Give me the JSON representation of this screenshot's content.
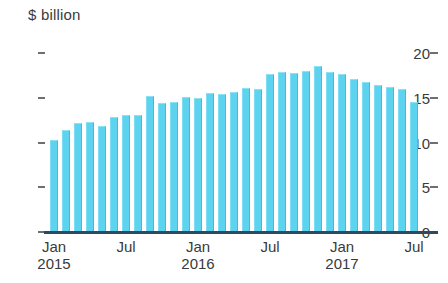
{
  "chart_data": {
    "type": "bar",
    "title": "$ billion",
    "xlabel": "",
    "ylabel": "$ billion",
    "ylim": [
      0,
      20
    ],
    "yticks": [
      0,
      5,
      10,
      15,
      20
    ],
    "ytick_labels": [
      "0",
      "5",
      "10",
      "15",
      "20"
    ],
    "grid": false,
    "legend": null,
    "bar_color": "#5cd3ef",
    "axis_color": "#2e4a63",
    "x_tick_positions": [
      0,
      6,
      12,
      18,
      24,
      30
    ],
    "x_tick_labels": [
      {
        "month": "Jan",
        "year": "2015"
      },
      {
        "month": "Jul",
        "year": ""
      },
      {
        "month": "Jan",
        "year": "2016"
      },
      {
        "month": "Jul",
        "year": ""
      },
      {
        "month": "Jan",
        "year": "2017"
      },
      {
        "month": "Jul",
        "year": ""
      }
    ],
    "categories": [
      "Jan 2015",
      "Feb 2015",
      "Mar 2015",
      "Apr 2015",
      "May 2015",
      "Jun 2015",
      "Jul 2015",
      "Aug 2015",
      "Sep 2015",
      "Oct 2015",
      "Nov 2015",
      "Dec 2015",
      "Jan 2016",
      "Feb 2016",
      "Mar 2016",
      "Apr 2016",
      "May 2016",
      "Jun 2016",
      "Jul 2016",
      "Aug 2016",
      "Sep 2016",
      "Oct 2016",
      "Nov 2016",
      "Dec 2016",
      "Jan 2017",
      "Feb 2017",
      "Mar 2017",
      "Apr 2017",
      "May 2017",
      "Jun 2017",
      "Jul 2017"
    ],
    "values": [
      10.3,
      11.4,
      12.2,
      12.3,
      11.8,
      12.8,
      13.1,
      13.1,
      15.2,
      14.4,
      14.5,
      15.1,
      15.0,
      15.5,
      15.4,
      15.7,
      16.1,
      16.0,
      17.7,
      17.9,
      17.8,
      18.0,
      18.5,
      17.9,
      17.6,
      17.1,
      16.8,
      16.4,
      16.2,
      16.0,
      14.5
    ]
  }
}
